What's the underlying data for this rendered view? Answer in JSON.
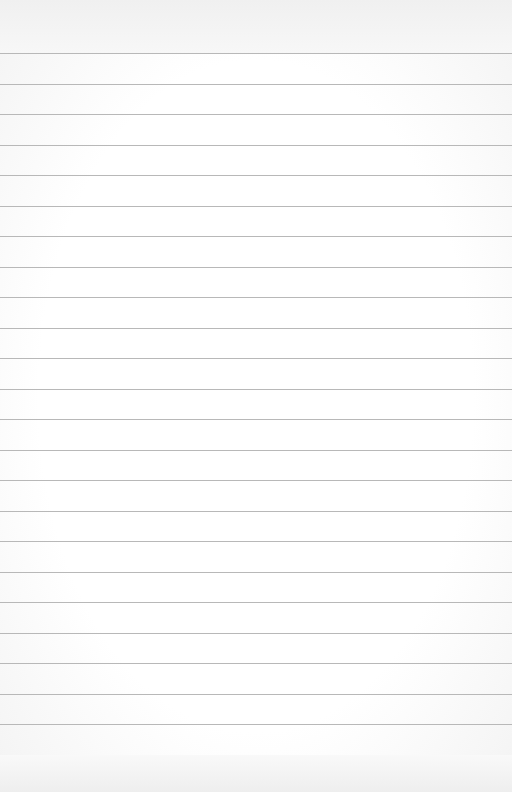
{
  "page": {
    "type": "lined-paper",
    "background_color": "#ffffff",
    "line_color": "#b8b8b8",
    "line_count": 24,
    "first_line_y": 53,
    "line_spacing": 30.5
  }
}
